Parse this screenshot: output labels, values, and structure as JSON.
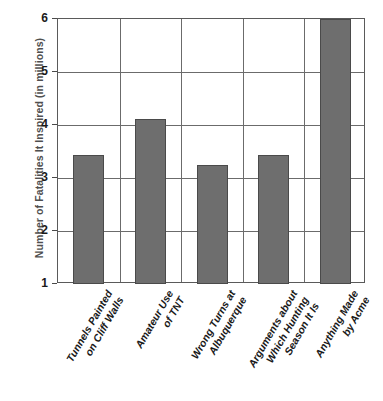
{
  "chart_data": {
    "type": "bar",
    "title": "",
    "xlabel": "",
    "ylabel": "Number of Fatalities It Inspired (in millions)",
    "ylim": [
      1,
      6
    ],
    "yticks": [
      1,
      2,
      3,
      4,
      5,
      6
    ],
    "ytick_labels": [
      "1",
      "2",
      "3",
      "4",
      "5",
      "6"
    ],
    "grid": true,
    "legend": "none",
    "bar_color": "#6e6e6e",
    "categories": [
      "Tunnels Painted\non Cliff Walls",
      "Amateur Use\nof TNT",
      "Wrong Turns at\nAlbuquerque",
      "Arguments about\nWhich Hunting\nSeason It Is",
      "Anything Made\nby Acme"
    ],
    "values": [
      3.43,
      4.11,
      3.25,
      3.43,
      6.0
    ]
  },
  "axis": {
    "y_title": "Number of Fatalities It Inspired (in millions)"
  }
}
